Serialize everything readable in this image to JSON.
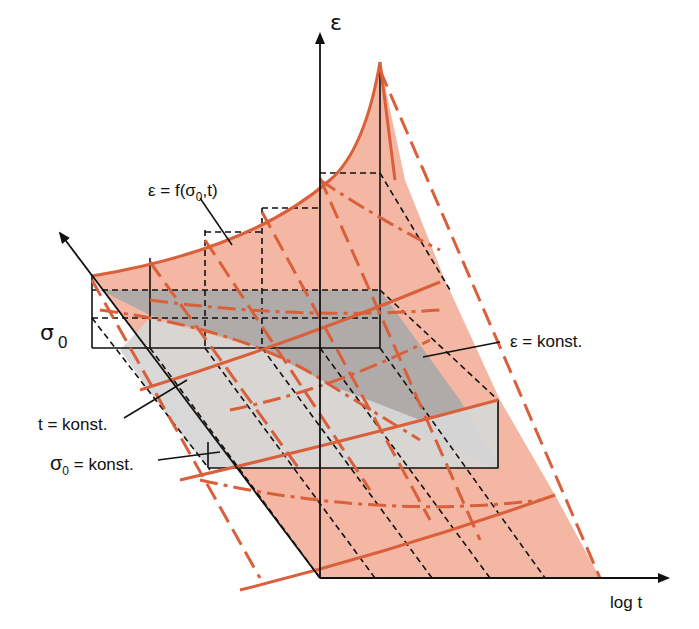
{
  "diagram": {
    "colors": {
      "surface_fill": "#f4b7a4",
      "surface_edge": "#d9603a",
      "grey_dark": "#a9a9a9",
      "grey_light": "#d6d6d6",
      "axis": "#111111"
    },
    "axes": {
      "epsilon": "ε",
      "sigma": "σ",
      "sigma_sub": "0",
      "time": "log t"
    },
    "labels": {
      "surface": "ε = f(σ",
      "surface_sub": "0",
      "surface_tail": ",t)",
      "eps_const": "ε = konst.",
      "t_const": "t = konst.",
      "sigma_const_sym": "σ",
      "sigma_const_sub": "0",
      "sigma_const_tail": " = konst."
    }
  }
}
